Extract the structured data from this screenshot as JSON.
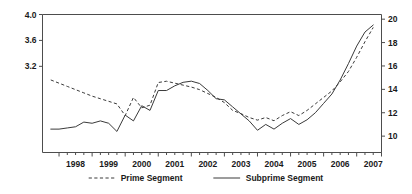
{
  "chart_data": {
    "type": "line",
    "title": "",
    "subtitle": "",
    "xlabel": "",
    "ylabel": "",
    "ylabel_right": "",
    "grid": false,
    "legend_position": "bottom",
    "x_tick_labels": [
      "1998",
      "1999",
      "2000",
      "2001",
      "2002",
      "2003",
      "2004",
      "2005",
      "2006",
      "2007"
    ],
    "x_minor_ticks_per_year": 4,
    "xlim": [
      1997.5,
      2007.75
    ],
    "left_axis": {
      "tick_labels": [
        "4.0",
        "3.6",
        "3.2"
      ],
      "tick_values": [
        4.0,
        3.6,
        3.2
      ],
      "ylim": [
        1.87,
        4.0
      ],
      "applies_to": "Prime Segment"
    },
    "right_axis": {
      "tick_labels": [
        "20",
        "18",
        "16",
        "14",
        "12",
        "10"
      ],
      "tick_values": [
        20,
        18,
        16,
        14,
        12,
        10
      ],
      "ylim": [
        8.6,
        20.4
      ],
      "applies_to": "Subprime Segment"
    },
    "series": [
      {
        "name": "Prime Segment",
        "style": "dashed",
        "axis": "left",
        "color": "#3a3a3a",
        "x": [
          1997.75,
          1998.0,
          1998.25,
          1998.5,
          1998.75,
          1999.0,
          1999.25,
          1999.5,
          1999.75,
          2000.0,
          2000.25,
          2000.5,
          2000.75,
          2001.0,
          2001.25,
          2001.5,
          2001.75,
          2002.0,
          2002.25,
          2002.5,
          2002.75,
          2003.0,
          2003.25,
          2003.5,
          2003.75,
          2004.0,
          2004.25,
          2004.5,
          2004.75,
          2005.0,
          2005.25,
          2005.5,
          2005.75,
          2006.0,
          2006.25,
          2006.5,
          2006.75,
          2007.0,
          2007.25,
          2007.5
        ],
        "y": [
          2.99,
          2.94,
          2.89,
          2.84,
          2.79,
          2.74,
          2.7,
          2.66,
          2.62,
          2.44,
          2.72,
          2.56,
          2.6,
          2.95,
          2.97,
          2.94,
          2.91,
          2.88,
          2.84,
          2.78,
          2.72,
          2.64,
          2.52,
          2.47,
          2.41,
          2.37,
          2.41,
          2.36,
          2.44,
          2.5,
          2.44,
          2.52,
          2.62,
          2.72,
          2.82,
          2.96,
          3.12,
          3.34,
          3.58,
          3.8
        ]
      },
      {
        "name": "Subprime Segment",
        "style": "solid",
        "axis": "right",
        "color": "#3a3a3a",
        "x": [
          1997.75,
          1998.0,
          1998.25,
          1998.5,
          1998.75,
          1999.0,
          1999.25,
          1999.5,
          1999.75,
          2000.0,
          2000.25,
          2000.5,
          2000.75,
          2001.0,
          2001.25,
          2001.5,
          2001.75,
          2002.0,
          2002.25,
          2002.5,
          2002.75,
          2003.0,
          2003.25,
          2003.5,
          2003.75,
          2004.0,
          2004.25,
          2004.5,
          2004.75,
          2005.0,
          2005.25,
          2005.5,
          2005.75,
          2006.0,
          2006.25,
          2006.5,
          2006.75,
          2007.0,
          2007.25,
          2007.5
        ],
        "y": [
          10.6,
          10.6,
          10.7,
          10.8,
          11.2,
          11.1,
          11.3,
          11.1,
          10.4,
          11.8,
          11.3,
          12.6,
          12.2,
          13.9,
          13.9,
          14.3,
          14.6,
          14.7,
          14.5,
          13.9,
          13.2,
          13.1,
          12.5,
          11.9,
          11.3,
          10.5,
          11.0,
          10.6,
          11.1,
          11.5,
          11.0,
          11.4,
          12.0,
          12.8,
          13.6,
          14.8,
          16.2,
          17.7,
          18.9,
          19.5
        ]
      }
    ],
    "legend": [
      {
        "label": "Prime Segment",
        "style": "dashed"
      },
      {
        "label": "Subprime Segment",
        "style": "solid"
      }
    ],
    "annotations": []
  }
}
